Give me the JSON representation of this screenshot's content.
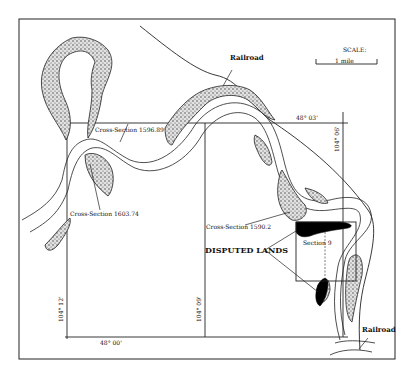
{
  "map": {
    "colors": {
      "ink": "#1a1a1a",
      "stipple_fill": "#bdbdbd",
      "disputed_fill": "#000000",
      "background": "#ffffff"
    },
    "scale": {
      "title": "SCALE:",
      "label": "1 mile"
    },
    "labels": {
      "railroad_top": "Railroad",
      "railroad_bottom": "Railroad",
      "cross_section_1": "Cross-Section 1596.89",
      "cross_section_2": "Cross-Section 1603.74",
      "cross_section_3": "Cross-Section 1590.2",
      "disputed_lands": "DISPUTED LANDS",
      "section": "Section 9"
    },
    "coordinates": {
      "lat_top": "48° 03'",
      "lat_bottom": "48° 00'",
      "lon_left": "104° 12'",
      "lon_middle": "104° 09'",
      "lon_right": "104° 06'"
    },
    "legend": {
      "stippled_area": "sandbar / river bank deposits",
      "black_area": "disputed lands"
    }
  }
}
